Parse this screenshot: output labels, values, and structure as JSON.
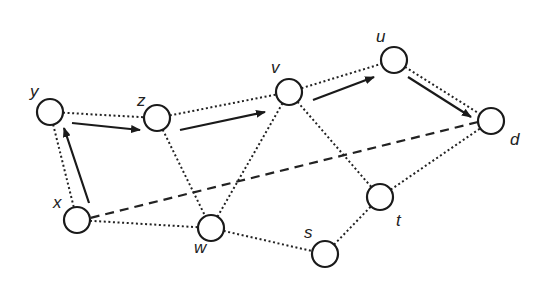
{
  "diagram": {
    "type": "network-graph",
    "colors": {
      "stroke": "#1a1a1a",
      "background": "#ffffff"
    },
    "nodes": [
      {
        "id": "y",
        "label": "y",
        "cx": 50,
        "cy": 112,
        "lx": 30,
        "ly": 97
      },
      {
        "id": "z",
        "label": "z",
        "cx": 157,
        "cy": 118,
        "lx": 137,
        "ly": 106
      },
      {
        "id": "v",
        "label": "v",
        "cx": 289,
        "cy": 92,
        "lx": 271,
        "ly": 73
      },
      {
        "id": "u",
        "label": "u",
        "cx": 394,
        "cy": 60,
        "lx": 376,
        "ly": 42
      },
      {
        "id": "d",
        "label": "d",
        "cx": 491,
        "cy": 121,
        "lx": 510,
        "ly": 145
      },
      {
        "id": "x",
        "label": "x",
        "cx": 77,
        "cy": 220,
        "lx": 53,
        "ly": 208
      },
      {
        "id": "w",
        "label": "w",
        "cx": 211,
        "cy": 228,
        "lx": 194,
        "ly": 253
      },
      {
        "id": "s",
        "label": "s",
        "cx": 325,
        "cy": 254,
        "lx": 304,
        "ly": 238
      },
      {
        "id": "t",
        "label": "t",
        "cx": 380,
        "cy": 197,
        "lx": 396,
        "ly": 226
      }
    ],
    "node_radius": 13,
    "dotted_edges": [
      [
        "y",
        "z"
      ],
      [
        "z",
        "v"
      ],
      [
        "v",
        "u"
      ],
      [
        "u",
        "d"
      ],
      [
        "y",
        "x"
      ],
      [
        "x",
        "w"
      ],
      [
        "z",
        "w"
      ],
      [
        "v",
        "w"
      ],
      [
        "v",
        "t"
      ],
      [
        "w",
        "s"
      ],
      [
        "s",
        "t"
      ],
      [
        "t",
        "d"
      ]
    ],
    "dashed_edges": [
      {
        "from": "d",
        "to": "x",
        "x1": 478,
        "y1": 122,
        "x2": 90,
        "y2": 218
      }
    ],
    "arrows": [
      {
        "from": "x",
        "to": "y",
        "x1": 89,
        "y1": 203,
        "x2": 64,
        "y2": 128
      },
      {
        "from": "y",
        "to": "z",
        "x1": 72,
        "y1": 123,
        "x2": 140,
        "y2": 130
      },
      {
        "from": "z",
        "to": "v",
        "x1": 180,
        "y1": 130,
        "x2": 265,
        "y2": 112
      },
      {
        "from": "v",
        "to": "u",
        "x1": 313,
        "y1": 100,
        "x2": 374,
        "y2": 77
      },
      {
        "from": "u",
        "to": "d",
        "x1": 408,
        "y1": 77,
        "x2": 471,
        "y2": 117
      }
    ]
  }
}
